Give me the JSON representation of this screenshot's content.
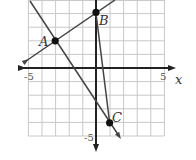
{
  "diagram": {
    "type": "coordinate-plane",
    "axis_labels": {
      "x": "x",
      "y": "y"
    },
    "tick_labels": {
      "x_min": "-5",
      "x_max": "5",
      "y_min": "-5",
      "y_max": "5"
    },
    "range": {
      "x": [
        -5,
        5
      ],
      "y": [
        -5,
        5
      ]
    },
    "points": [
      {
        "label": "A",
        "x": -3,
        "y": 2
      },
      {
        "label": "B",
        "x": 0,
        "y": 4
      },
      {
        "label": "C",
        "x": 1,
        "y": -4
      }
    ],
    "lines": [
      {
        "name": "line-AB",
        "through": [
          "A",
          "B"
        ],
        "arrows": true
      },
      {
        "name": "line-AC",
        "through": [
          "A",
          "C"
        ],
        "arrows": true
      },
      {
        "name": "segment-BC",
        "through": [
          "B",
          "C"
        ],
        "arrows": false
      }
    ],
    "colors": {
      "axis": "#222222",
      "grid": "#c8c8c8",
      "line": "#444444",
      "point": "#111111"
    }
  }
}
